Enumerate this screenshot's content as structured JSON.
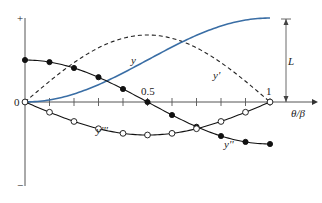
{
  "chart_data": {
    "type": "line",
    "title": "",
    "xlabel": "θ/β",
    "ylabel": "",
    "x_ticks": [
      0,
      0.1,
      0.2,
      0.3,
      0.4,
      0.5,
      0.6,
      0.7,
      0.8,
      0.9,
      1
    ],
    "x_tick_labels": {
      "origin": "0",
      "mid": "0.5",
      "end": "1"
    },
    "y_axis_labels": {
      "top": "+",
      "bottom": "−"
    },
    "xlim": [
      0,
      1
    ],
    "grid": false,
    "annotations": [
      {
        "text": "L",
        "description": "total rise, dimension arrow from 0 to maximum of y at θ/β = 1"
      }
    ],
    "series": [
      {
        "name": "y",
        "style": "solid",
        "color": "#3a6ea5",
        "x": [
          0,
          0.1,
          0.2,
          0.3,
          0.4,
          0.5,
          0.6,
          0.7,
          0.8,
          0.9,
          1
        ],
        "values": [
          0,
          0.024,
          0.095,
          0.206,
          0.345,
          0.5,
          0.655,
          0.794,
          0.905,
          0.976,
          1.0
        ]
      },
      {
        "name": "y'",
        "style": "dashed",
        "color": "#222222",
        "x": [
          0,
          0.1,
          0.2,
          0.3,
          0.4,
          0.5,
          0.6,
          0.7,
          0.8,
          0.9,
          1
        ],
        "values": [
          0,
          0.31,
          0.59,
          0.81,
          0.95,
          1.0,
          0.95,
          0.81,
          0.59,
          0.31,
          0
        ]
      },
      {
        "name": "y''",
        "style": "solid-filled-markers",
        "color": "#111111",
        "x": [
          0,
          0.1,
          0.2,
          0.3,
          0.4,
          0.5,
          0.6,
          0.7,
          0.8,
          0.9,
          1
        ],
        "values": [
          1.0,
          0.95,
          0.81,
          0.59,
          0.31,
          0,
          -0.31,
          -0.59,
          -0.81,
          -0.95,
          -1.0
        ]
      },
      {
        "name": "y'''",
        "style": "solid-open-markers",
        "color": "#111111",
        "x": [
          0,
          0.1,
          0.2,
          0.3,
          0.4,
          0.5,
          0.6,
          0.7,
          0.8,
          0.9,
          1
        ],
        "values": [
          0,
          -0.31,
          -0.59,
          -0.81,
          -0.95,
          -1.0,
          -0.95,
          -0.81,
          -0.59,
          -0.31,
          0
        ]
      }
    ]
  },
  "labels": {
    "origin": "0",
    "half": "0.5",
    "one": "1",
    "xlabel": "θ/β",
    "plus": "+",
    "minus": "−",
    "L": "L",
    "y": "y",
    "y1": "y'",
    "y2": "y''",
    "y3": "y'''"
  }
}
